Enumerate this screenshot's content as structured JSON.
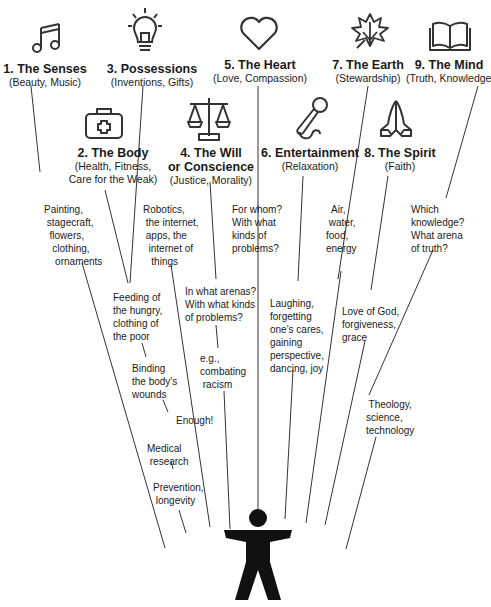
{
  "categories": [
    {
      "num": "1. The Senses",
      "sub": "(Beauty, Music)",
      "icon": "music-note-icon"
    },
    {
      "num": "2. The Body",
      "sub": "(Health, Fitness,\nCare for the Weak)",
      "sub1": "(Health, Fitness,",
      "sub2": "Care for the Weak)",
      "icon": "first-aid-kit-icon"
    },
    {
      "num": "3. Possessions",
      "sub": "(Inventions, Gifts)",
      "icon": "light-bulb-icon"
    },
    {
      "num1": "4. The Will",
      "num2": "or Conscience",
      "sub": "(Justice, Morality)",
      "icon": "scales-icon"
    },
    {
      "num": "5. The Heart",
      "sub": "(Love, Compassion)",
      "icon": "heart-icon"
    },
    {
      "num": "6. Entertainment",
      "sub": "(Relaxation)",
      "icon": "microphone-icon"
    },
    {
      "num": "7. The Earth",
      "sub": "(Stewardship)",
      "icon": "leaf-icon"
    },
    {
      "num": "8. The Spirit",
      "sub": "(Faith)",
      "icon": "praying-hands-icon"
    },
    {
      "num": "9. The Mind",
      "sub": "(Truth, Knowledge)",
      "icon": "open-book-icon"
    }
  ],
  "notes": {
    "senses": "Painting,\n stagecraft,\n  flowers,\n   clothing,\n    ornaments",
    "possessions": "Robotics,\n the internet,\n apps, the\n  internet of\n   things",
    "heart": "For whom?\nWith what\nkinds of\nproblems?",
    "earth": "  Air,\n water,\nfood,\nenergy",
    "mind": "Which\nknowledge?\nWhat arena\nof truth?",
    "will": "In what arenas?\nWith what kinds\nof problems?",
    "will_eg": "e.g.,\ncombating\n racism",
    "body1": "Feeding of\nthe hungry,\nclothing of\nthe poor",
    "body2": "Binding\nthe body's\nwounds",
    "enough": "Enough!",
    "body3": "Medical\n research",
    "body4": "Prevention,\n longevity",
    "entertainment": "Laughing,\nforgetting\none's cares,\ngaining\nperspective,\ndancing, joy",
    "spirit": "Love of God,\nforgiveness,\ngrace",
    "mind2": " Theology,\nscience,\ntechnology"
  },
  "figure": {
    "name": "person-figure"
  },
  "colors": {
    "ink": "#1a1a1a",
    "line": "#2a2a2a",
    "background": "#ffffff"
  }
}
